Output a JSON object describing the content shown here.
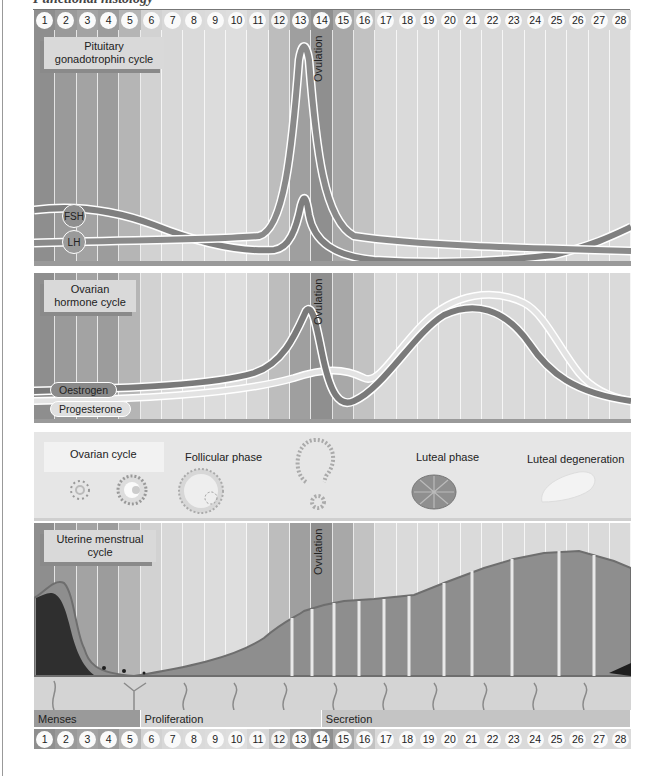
{
  "header": {
    "title": "Functional histology"
  },
  "days": [
    "1",
    "2",
    "3",
    "4",
    "5",
    "6",
    "7",
    "8",
    "9",
    "10",
    "11",
    "12",
    "13",
    "14",
    "15",
    "16",
    "17",
    "18",
    "19",
    "20",
    "21",
    "22",
    "23",
    "24",
    "25",
    "26",
    "27",
    "28"
  ],
  "band_colors": [
    "#8e8e8e",
    "#9a9a9a",
    "#a3a3a3",
    "#9c9c9c",
    "#b5b5b5",
    "#d2d2d2",
    "#d8d8d8",
    "#dadada",
    "#dcdcdc",
    "#dedede",
    "#d6d6d6",
    "#bdbdbd",
    "#9f9f9f",
    "#8f8f8f",
    "#a8a8a8",
    "#c2c2c2",
    "#d9d9d9",
    "#dadada",
    "#dadada",
    "#dadada",
    "#dadada",
    "#dadada",
    "#dadada",
    "#dadada",
    "#dadada",
    "#dadada",
    "#dadada",
    "#dadada"
  ],
  "pituitary": {
    "label": "Pituitary gonadotrophin cycle",
    "ovulation_label": "Ovulation",
    "fsh_label": "FSH",
    "lh_label": "LH"
  },
  "ovarian_hormone": {
    "label": "Ovarian hormone cycle",
    "ovulation_label": "Ovulation",
    "oestrogen_label": "Oestrogen",
    "progesterone_label": "Progesterone"
  },
  "ovarian_cycle": {
    "label": "Ovarian cycle",
    "follicular_label": "Follicular phase",
    "luteal_label": "Luteal phase",
    "degeneration_label": "Luteal degeneration"
  },
  "uterine": {
    "label": "Uterine menstrual cycle",
    "ovulation_label": "Ovulation"
  },
  "phases": [
    {
      "label": "Menses",
      "days": 5,
      "color": "#9a9a9a"
    },
    {
      "label": "Proliferation",
      "days": 8.5,
      "color": "#d5d5d5"
    },
    {
      "label": "Secretion",
      "days": 14.5,
      "color": "#c4c4c4"
    }
  ],
  "chart_data": {
    "type": "line",
    "x": [
      1,
      2,
      3,
      4,
      5,
      6,
      7,
      8,
      9,
      10,
      11,
      12,
      13,
      14,
      15,
      16,
      17,
      18,
      19,
      20,
      21,
      22,
      23,
      24,
      25,
      26,
      27,
      28
    ],
    "xlabel": "Day of cycle",
    "annotations": [
      "Ovulation (day 14)"
    ],
    "panels": [
      {
        "name": "Pituitary gonadotrophin cycle",
        "series": [
          {
            "name": "FSH",
            "values": [
              22,
              22,
              21,
              19,
              17,
              15,
              13,
              11,
              10,
              11,
              12,
              16,
              34,
              18,
              12,
              9,
              8,
              7,
              7,
              7,
              7,
              7,
              8,
              10,
              12,
              14,
              16,
              19
            ]
          },
          {
            "name": "LH",
            "values": [
              10,
              10,
              10,
              10,
              10,
              10,
              10,
              10,
              10,
              11,
              12,
              22,
              95,
              25,
              14,
              11,
              9,
              8,
              7,
              6,
              6,
              5,
              5,
              5,
              4,
              4,
              4,
              4
            ]
          }
        ]
      },
      {
        "name": "Ovarian hormone cycle",
        "series": [
          {
            "name": "Oestrogen",
            "values": [
              12,
              12,
              13,
              13,
              14,
              14,
              15,
              16,
              18,
              22,
              35,
              78,
              30,
              10,
              14,
              25,
              40,
              55,
              65,
              70,
              68,
              55,
              35,
              20,
              14,
              12,
              11,
              10
            ]
          },
          {
            "name": "Progesterone",
            "values": [
              5,
              5,
              5,
              6,
              6,
              7,
              8,
              9,
              12,
              18,
              22,
              26,
              30,
              28,
              28,
              45,
              65,
              82,
              92,
              95,
              92,
              80,
              55,
              28,
              15,
              10,
              8,
              7
            ]
          }
        ]
      }
    ]
  }
}
